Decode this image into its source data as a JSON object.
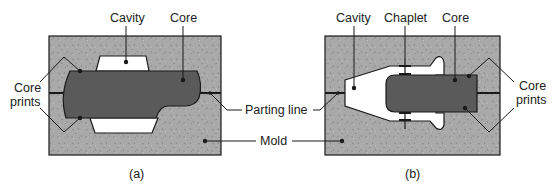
{
  "figure": {
    "panel_a": {
      "caption": "(a)",
      "labels": {
        "cavity": "Cavity",
        "core": "Core",
        "core_prints_line1": "Core",
        "core_prints_line2": "prints"
      }
    },
    "panel_b": {
      "caption": "(b)",
      "labels": {
        "cavity": "Cavity",
        "chaplet": "Chaplet",
        "core": "Core",
        "core_prints_line1": "Core",
        "core_prints_line2": "prints"
      }
    },
    "shared_labels": {
      "parting_line": "Parting line",
      "mold": "Mold"
    },
    "colors": {
      "mold_fill": "#a9a9a9",
      "core_fill": "#5a5a5a",
      "cavity_fill": "#ffffff",
      "outline": "#1a1a1a"
    }
  }
}
